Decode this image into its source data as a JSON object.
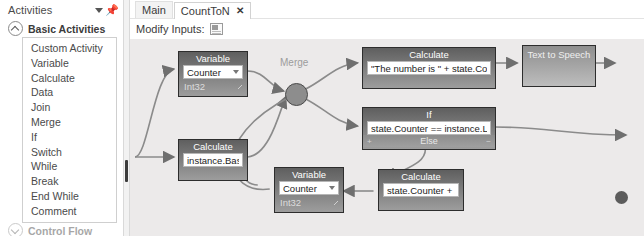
{
  "sidebar": {
    "title": "Activities",
    "caret_icon": "chevron-down-icon",
    "pin_icon": "pin-icon",
    "groups": [
      {
        "label": "Basic Activities",
        "expanded": true
      },
      {
        "label": "Control Flow",
        "expanded": false
      }
    ],
    "items": [
      {
        "label": "Custom Activity"
      },
      {
        "label": "Variable"
      },
      {
        "label": "Calculate"
      },
      {
        "label": "Data"
      },
      {
        "label": "Join"
      },
      {
        "label": "Merge"
      },
      {
        "label": "If"
      },
      {
        "label": "Switch"
      },
      {
        "label": "While"
      },
      {
        "label": "Break"
      },
      {
        "label": "End While"
      },
      {
        "label": "Comment"
      }
    ]
  },
  "tabs": [
    {
      "label": "Main",
      "active": false,
      "closable": false
    },
    {
      "label": "CountToN",
      "active": true,
      "closable": true,
      "close_label": "✕"
    }
  ],
  "toolbar": {
    "modify_inputs_label": "Modify Inputs:",
    "modify_inputs_icon": "table-grid-icon"
  },
  "canvas": {
    "merge": {
      "label": "Merge"
    },
    "nodes": {
      "variable_top": {
        "title": "Variable",
        "value": "Counter",
        "type": "Int32"
      },
      "calculate_base": {
        "title": "Calculate",
        "expression": "instance.Base"
      },
      "calculate_message": {
        "title": "Calculate",
        "expression": "\"The number is \" + state.Counter"
      },
      "if_node": {
        "title": "If",
        "condition": "state.Counter == instance.Limit",
        "else_label": "Else",
        "left_mark": "+",
        "right_mark": "−"
      },
      "text_to_speech": {
        "title": "Text to Speech"
      },
      "variable_bottom": {
        "title": "Variable",
        "value": "Counter",
        "type": "Int32"
      },
      "calculate_increment": {
        "title": "Calculate",
        "expression": "state.Counter + 1"
      }
    }
  },
  "colors": {
    "canvas_bg": "#eceaea",
    "node_header": "#5f5f5f",
    "node_body": "#9d9d9d",
    "connector": "#8b8b8b",
    "merge_fill": "#8d8d8d"
  }
}
